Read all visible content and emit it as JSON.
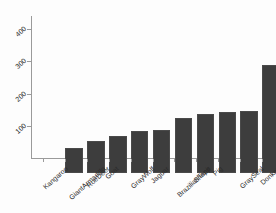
{
  "chart_data": {
    "type": "bar",
    "title": "",
    "subtitle": "",
    "xlabel": "",
    "ylabel": "",
    "categories": [
      "Kangaroo",
      "GiantArmadillo",
      "RoeDeer",
      "Goat",
      "GrayWolf",
      "Jaguar",
      "BrazilianTapir",
      "Sheep",
      "Pig",
      "GraySeal",
      "Donkey"
    ],
    "values": [
      78,
      100,
      116,
      130,
      134,
      172,
      184,
      190,
      193,
      336,
      428
    ],
    "ylim": [
      0,
      450
    ],
    "yticks": [
      100,
      200,
      300,
      400
    ],
    "ytick_labels": [
      "100",
      "200",
      "300",
      "400"
    ],
    "grid": false,
    "legend": false,
    "legend_position": "none",
    "bar_color": "#3d3d3d",
    "axis_color": "#9a9a9a",
    "background_color": "#fdfdfd",
    "label_rotation": -42
  }
}
